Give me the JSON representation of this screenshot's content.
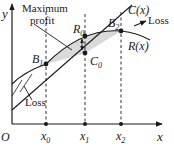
{
  "diagram": {
    "axes": {
      "y_label": "y",
      "x_label": "x",
      "origin_label": "O"
    },
    "x_ticks": [
      {
        "label": "x",
        "sub": "0"
      },
      {
        "label": "x",
        "sub": "1"
      },
      {
        "label": "x",
        "sub": "2"
      }
    ],
    "curves": {
      "cost": {
        "label": "C(x)"
      },
      "revenue": {
        "label": "R(x)"
      }
    },
    "points": {
      "b1": {
        "label": "B",
        "sub": "1"
      },
      "b2": {
        "label": "B",
        "sub": "2"
      },
      "r0": {
        "label": "R",
        "sub": "0"
      },
      "c0": {
        "label": "C",
        "sub": "0"
      }
    },
    "annotations": {
      "max_profit_line1": "Maximum",
      "max_profit_line2": "profit",
      "loss_left": "Loss",
      "loss_right": "Loss"
    },
    "colors": {
      "profit_region": "#d9d9d9",
      "lines": "#1a1a1a"
    }
  }
}
